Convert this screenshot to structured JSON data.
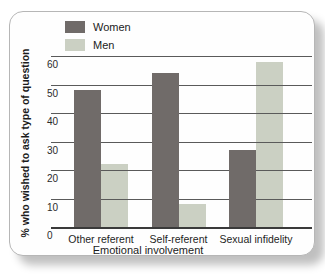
{
  "chart_data": {
    "type": "bar",
    "title": "",
    "categories": [
      "Other referent",
      "Self-referent",
      "Sexual infidelity"
    ],
    "series": [
      {
        "name": "Women",
        "color": "#706b69",
        "values": [
          48,
          54,
          27
        ]
      },
      {
        "name": "Men",
        "color": "#cbd0c3",
        "values": [
          22,
          8,
          58
        ]
      }
    ],
    "xlabel": "Emotional involvement",
    "ylabel": "% who wished to ask type of question",
    "ylim": [
      0,
      60
    ],
    "yticks": [
      0,
      10,
      20,
      30,
      40,
      50,
      60
    ],
    "grid": true,
    "legend_position": "top-left"
  },
  "colors": {
    "gridline": "#5a5a5a",
    "axis": "#3a3a3a",
    "panel_border": "#b6b6b6",
    "panel_background": "#fefefe",
    "text": "#222222"
  }
}
